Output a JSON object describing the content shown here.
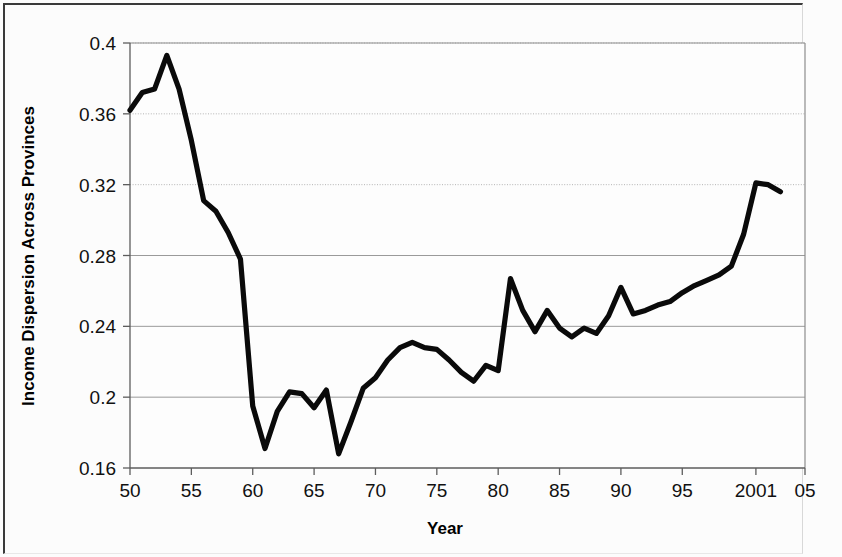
{
  "chart_data": {
    "type": "line",
    "title": "",
    "xlabel": "Year",
    "ylabel": "Income Dispersion Across Provinces",
    "xlim": [
      1950,
      2005
    ],
    "ylim": [
      0.16,
      0.4
    ],
    "xticks": [
      1950,
      1955,
      1960,
      1965,
      1970,
      1975,
      1980,
      1985,
      1990,
      1995,
      2001,
      2005
    ],
    "xtick_labels": [
      "50",
      "55",
      "60",
      "65",
      "70",
      "75",
      "80",
      "85",
      "90",
      "95",
      "2001",
      "05"
    ],
    "yticks": [
      0.16,
      0.2,
      0.24,
      0.28,
      0.32,
      0.36,
      0.4
    ],
    "ytick_labels": [
      "0.16",
      "0.2",
      "0.24",
      "0.28",
      "0.32",
      "0.36",
      "0.4"
    ],
    "grid": true,
    "legend": "none",
    "line_color": "#0a0a0a",
    "series": [
      {
        "name": "Income Dispersion Across Provinces",
        "x": [
          1950,
          1951,
          1952,
          1953,
          1954,
          1955,
          1956,
          1957,
          1958,
          1959,
          1960,
          1961,
          1962,
          1963,
          1964,
          1965,
          1966,
          1967,
          1968,
          1969,
          1970,
          1971,
          1972,
          1973,
          1974,
          1975,
          1976,
          1977,
          1978,
          1979,
          1980,
          1981,
          1982,
          1983,
          1984,
          1985,
          1986,
          1987,
          1988,
          1989,
          1990,
          1991,
          1992,
          1993,
          1994,
          1995,
          1996,
          1997,
          1998,
          1999,
          2000,
          2001,
          2002,
          2003
        ],
        "y": [
          0.362,
          0.372,
          0.374,
          0.393,
          0.374,
          0.345,
          0.311,
          0.305,
          0.293,
          0.278,
          0.195,
          0.171,
          0.192,
          0.203,
          0.202,
          0.194,
          0.204,
          0.168,
          0.186,
          0.205,
          0.211,
          0.221,
          0.228,
          0.231,
          0.228,
          0.227,
          0.221,
          0.214,
          0.209,
          0.218,
          0.215,
          0.267,
          0.249,
          0.237,
          0.249,
          0.239,
          0.234,
          0.239,
          0.236,
          0.246,
          0.262,
          0.247,
          0.249,
          0.252,
          0.254,
          0.259,
          0.263,
          0.266,
          0.269,
          0.274,
          0.292,
          0.321,
          0.32,
          0.316
        ]
      }
    ]
  },
  "axis": {
    "y_title": "Income Dispersion Across Provinces",
    "x_title": "Year"
  }
}
